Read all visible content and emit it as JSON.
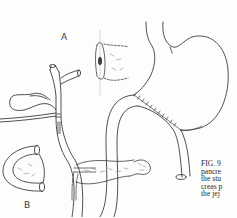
{
  "figure": {
    "panel_labels": {
      "a": "A",
      "b": "B"
    },
    "caption_lines": [
      "FIG. 9",
      "pancre",
      "the stu",
      "creas p",
      "the jej"
    ],
    "structures": [
      "stomach",
      "gastrojejunal-anastomosis",
      "jejunal-loop",
      "common-bile-duct",
      "hepatic-duct-bifurcation",
      "gallbladder",
      "t-tube-drain",
      "pancreas-remnant",
      "pancreaticojejunal-anastomosis",
      "pancreatic-stump-detail"
    ],
    "ink_color": "#3c3c3c",
    "paper_color": "#fdfdfc"
  }
}
